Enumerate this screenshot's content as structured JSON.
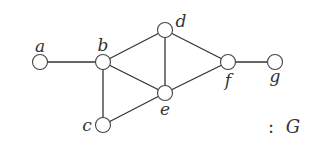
{
  "graph": {
    "name": "G",
    "caption": ": G",
    "caption_prefix": ":",
    "caption_name": "G",
    "nodes": [
      {
        "id": "a",
        "label": "a",
        "x": 40,
        "y": 62,
        "label_x": 40,
        "label_y": 52
      },
      {
        "id": "b",
        "label": "b",
        "x": 103,
        "y": 62,
        "label_x": 103,
        "label_y": 51
      },
      {
        "id": "c",
        "label": "c",
        "x": 103,
        "y": 125,
        "label_x": 87,
        "label_y": 131
      },
      {
        "id": "d",
        "label": "d",
        "x": 165,
        "y": 30,
        "label_x": 181,
        "label_y": 27
      },
      {
        "id": "e",
        "label": "e",
        "x": 165,
        "y": 93,
        "label_x": 165,
        "label_y": 115
      },
      {
        "id": "f",
        "label": "f",
        "x": 228,
        "y": 62,
        "label_x": 228,
        "label_y": 86
      },
      {
        "id": "g",
        "label": "g",
        "x": 275,
        "y": 62,
        "label_x": 275,
        "label_y": 82
      }
    ],
    "edges": [
      [
        "a",
        "b"
      ],
      [
        "b",
        "c"
      ],
      [
        "b",
        "d"
      ],
      [
        "b",
        "e"
      ],
      [
        "c",
        "e"
      ],
      [
        "d",
        "e"
      ],
      [
        "d",
        "f"
      ],
      [
        "e",
        "f"
      ],
      [
        "f",
        "g"
      ]
    ],
    "node_radius": 7.5
  }
}
